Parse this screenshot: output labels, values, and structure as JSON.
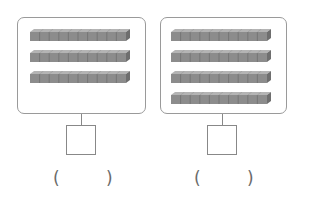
{
  "diagram": {
    "type": "base-ten-rods-counting",
    "panels": [
      {
        "id": "left",
        "rod_count": 3,
        "cubes_per_rod": 10,
        "answer_box": "",
        "answer_parentheses": {
          "open": "(",
          "close": ")",
          "value": ""
        }
      },
      {
        "id": "right",
        "rod_count": 4,
        "cubes_per_rod": 10,
        "answer_box": "",
        "answer_parentheses": {
          "open": "(",
          "close": ")",
          "value": ""
        }
      }
    ],
    "colors": {
      "frame_border": "#9a9a9a",
      "rod_front": "#8c8c8c",
      "rod_top": "#b4b4b4",
      "rod_end": "#6e6e6e",
      "rod_divider": "#707070",
      "stem": "#888888"
    }
  }
}
